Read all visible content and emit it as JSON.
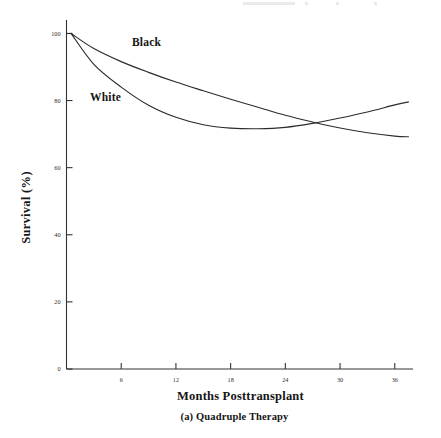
{
  "chart_data": {
    "type": "line",
    "title": "",
    "caption": "(a) Quadruple Therapy",
    "xlabel": "Months Posttransplant",
    "ylabel": "Survival (%)",
    "xlim": [
      0,
      38
    ],
    "ylim": [
      0,
      104
    ],
    "xticks": [
      6,
      12,
      18,
      24,
      30,
      36
    ],
    "xtick_labels": [
      "6",
      "12",
      "18",
      "24",
      "30",
      "36"
    ],
    "yticks": [
      0,
      20,
      40,
      60,
      80,
      100
    ],
    "ytick_labels": [
      "0",
      "20",
      "40",
      "60",
      "80",
      "100"
    ],
    "grid": false,
    "legend": "inline-curve-labels",
    "x": [
      0.5,
      3,
      6,
      9,
      12,
      15,
      18,
      21,
      24,
      27,
      30,
      33,
      36,
      37.5
    ],
    "series": [
      {
        "name": "Black",
        "label": "Black",
        "color": "#2b2b2b",
        "values": [
          100,
          95.5,
          91.6,
          88.4,
          85.5,
          82.9,
          80.4,
          78.0,
          75.6,
          73.6,
          71.8,
          70.4,
          69.4,
          69.2
        ]
      },
      {
        "name": "White",
        "label": "White",
        "color": "#2b2b2b",
        "values": [
          100,
          90.8,
          84.0,
          78.6,
          75.0,
          72.8,
          71.8,
          71.6,
          72.0,
          73.2,
          74.8,
          76.6,
          78.7,
          79.6
        ]
      }
    ],
    "annotations": [
      {
        "text": "Black",
        "x": 8.5,
        "y": 92.5
      },
      {
        "text": "White",
        "x": 3.0,
        "y": 77.5
      }
    ],
    "crossing_point": {
      "x": 26.5,
      "y": 73.8
    }
  }
}
